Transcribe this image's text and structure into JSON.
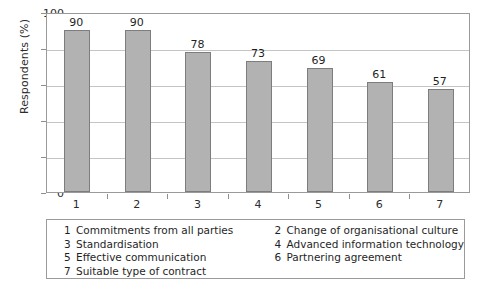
{
  "chart_data": {
    "type": "bar",
    "title": "",
    "xlabel": "",
    "ylabel": "Respondents (%)",
    "categories": [
      "1",
      "2",
      "3",
      "4",
      "5",
      "6",
      "7"
    ],
    "values": [
      90,
      90,
      78,
      73,
      69,
      61,
      57
    ],
    "value_labels": [
      "90",
      "90",
      "78",
      "73",
      "69",
      "61",
      "57"
    ],
    "ylim": [
      0,
      100
    ],
    "ytick_labels": [
      "0",
      "20",
      "40",
      "60",
      "80",
      "100"
    ],
    "ytick_values": [
      0,
      20,
      40,
      60,
      80,
      100
    ],
    "grid": true,
    "legend_position": "below-plot",
    "bar_color": "#b2b2b2",
    "bar_border_color": "#7d7d7d",
    "gridline_color": "#c4c4c4",
    "frame_color": "#9a9a9a",
    "legend": [
      {
        "num": "1",
        "label": "Commitments from all parties"
      },
      {
        "num": "2",
        "label": "Change of organisational culture"
      },
      {
        "num": "3",
        "label": "Standardisation"
      },
      {
        "num": "4",
        "label": "Advanced information technology"
      },
      {
        "num": "5",
        "label": "Effective communication"
      },
      {
        "num": "6",
        "label": "Partnering agreement"
      },
      {
        "num": "7",
        "label": "Suitable type of contract"
      }
    ],
    "legend_left_column": [
      {
        "num": "1",
        "label": "Commitments from all parties"
      },
      {
        "num": "3",
        "label": "Standardisation"
      },
      {
        "num": "5",
        "label": "Effective communication"
      },
      {
        "num": "7",
        "label": "Suitable type of contract"
      }
    ],
    "legend_right_column": [
      {
        "num": "2",
        "label": "Change of organisational culture"
      },
      {
        "num": "4",
        "label": "Advanced information technology"
      },
      {
        "num": "6",
        "label": "Partnering agreement"
      }
    ]
  }
}
